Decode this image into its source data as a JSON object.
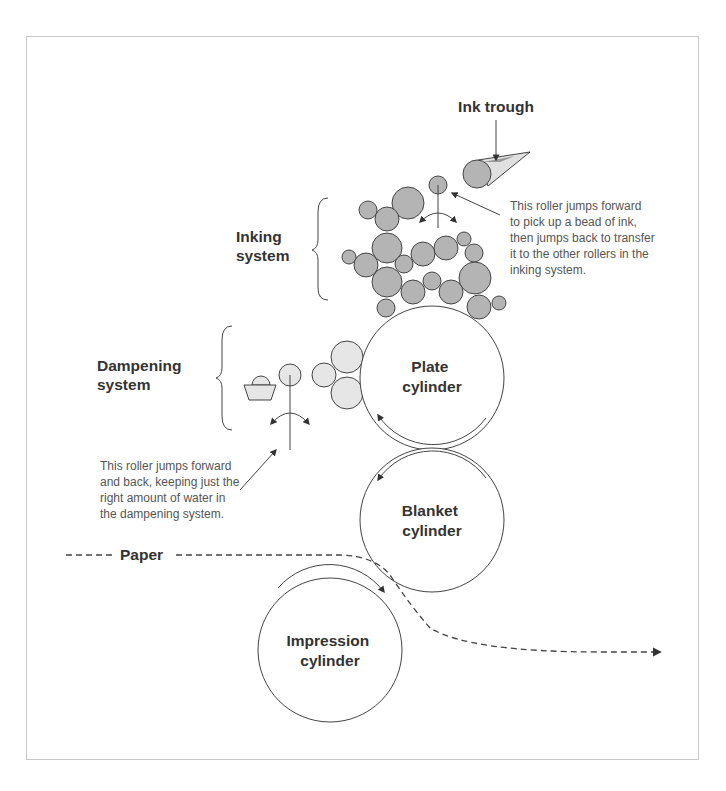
{
  "diagram": {
    "title_labels": {
      "ink_trough": "Ink trough",
      "inking_system": [
        "Inking",
        "system"
      ],
      "dampening_system": [
        "Dampening",
        "system"
      ],
      "paper": "Paper"
    },
    "cylinders": {
      "plate": [
        "Plate",
        "cylinder"
      ],
      "blanket": [
        "Blanket",
        "cylinder"
      ],
      "impression": [
        "Impression",
        "cylinder"
      ]
    },
    "notes": {
      "ink_roller": [
        "This roller jumps forward",
        "to pick up a bead of ink,",
        "then jumps back to transfer",
        "it to the other rollers in the",
        "inking system."
      ],
      "dampening_roller": [
        "This roller jumps forward",
        "and back, keeping just the",
        "right amount of water in",
        "the dampening system."
      ]
    },
    "colors": {
      "ink_roller_fill": "#b4b4b4",
      "water_roller_fill": "#e6e6e6",
      "stroke": "#444444",
      "text": "#333333",
      "frame": "#c8c8c8"
    }
  }
}
